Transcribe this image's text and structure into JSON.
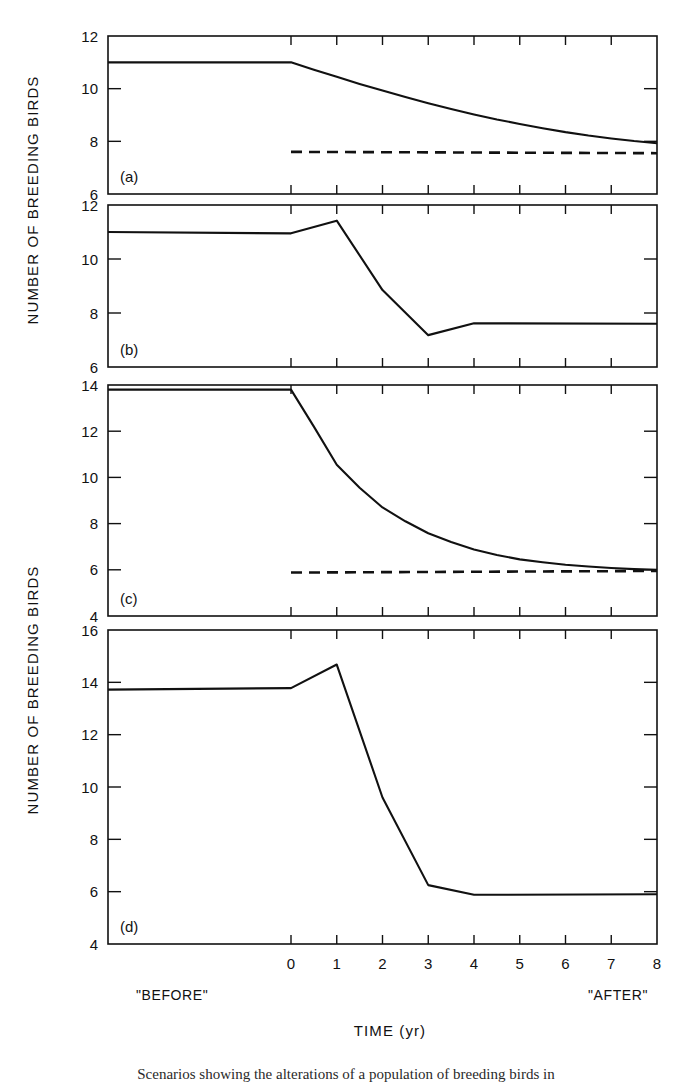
{
  "figure": {
    "ylabel_top": "NUMBER OF BREEDING BIRDS",
    "ylabel_bottom": "NUMBER OF BREEDING BIRDS",
    "xlabel": "TIME (yr)",
    "before_label": "\"BEFORE\"",
    "after_label": "\"AFTER\"",
    "caption": "Scenarios showing the alterations of a population of breeding birds in",
    "ink_color": "#111111",
    "background_color": "#ffffff"
  },
  "chart_data": [
    {
      "type": "line",
      "panel": "(a)",
      "title": "",
      "xlabel": "TIME (yr)",
      "ylabel": "NUMBER OF BREEDING BIRDS",
      "xlim": [
        -4,
        8
      ],
      "ylim": [
        6,
        12
      ],
      "xticks": [
        0,
        1,
        2,
        3,
        4,
        5,
        6,
        7,
        8
      ],
      "xticklabels": [
        "",
        "",
        "",
        "",
        "",
        "",
        "",
        "",
        ""
      ],
      "yticks": [
        6,
        8,
        10,
        12
      ],
      "yticklabels": [
        "6",
        "8",
        "10",
        "12"
      ],
      "grid": false,
      "series": [
        {
          "name": "population",
          "style": "solid",
          "x": [
            -4,
            -3,
            -2,
            -1,
            0,
            0.5,
            1,
            1.5,
            2,
            2.5,
            3,
            3.5,
            4,
            4.5,
            5,
            5.5,
            6,
            6.5,
            7,
            7.5,
            8
          ],
          "values": [
            11.0,
            11.0,
            11.0,
            11.0,
            11.0,
            10.72,
            10.45,
            10.18,
            9.93,
            9.68,
            9.45,
            9.23,
            9.02,
            8.83,
            8.66,
            8.5,
            8.35,
            8.22,
            8.11,
            8.01,
            7.93
          ]
        },
        {
          "name": "new-equilibrium",
          "style": "dashed",
          "x": [
            0,
            8
          ],
          "values": [
            7.6,
            7.55
          ]
        }
      ]
    },
    {
      "type": "line",
      "panel": "(b)",
      "title": "",
      "xlabel": "TIME (yr)",
      "ylabel": "NUMBER OF BREEDING BIRDS",
      "xlim": [
        -4,
        8
      ],
      "ylim": [
        6,
        12
      ],
      "xticks": [
        0,
        1,
        2,
        3,
        4,
        5,
        6,
        7,
        8
      ],
      "xticklabels": [
        "",
        "",
        "",
        "",
        "",
        "",
        "",
        "",
        ""
      ],
      "yticks": [
        6,
        8,
        10,
        12
      ],
      "yticklabels": [
        "6",
        "8",
        "10",
        "12"
      ],
      "grid": false,
      "series": [
        {
          "name": "population",
          "style": "solid",
          "x": [
            -4,
            0,
            1,
            2,
            3,
            4,
            8
          ],
          "values": [
            11.0,
            10.95,
            11.42,
            8.85,
            7.18,
            7.62,
            7.6
          ]
        }
      ]
    },
    {
      "type": "line",
      "panel": "(c)",
      "title": "",
      "xlabel": "TIME (yr)",
      "ylabel": "NUMBER OF BREEDING BIRDS",
      "xlim": [
        -4,
        8
      ],
      "ylim": [
        4,
        14
      ],
      "xticks": [
        0,
        1,
        2,
        3,
        4,
        5,
        6,
        7,
        8
      ],
      "xticklabels": [
        "",
        "",
        "",
        "",
        "",
        "",
        "",
        "",
        ""
      ],
      "yticks": [
        4,
        6,
        8,
        10,
        12,
        14
      ],
      "yticklabels": [
        "4",
        "6",
        "8",
        "10",
        "12",
        "14"
      ],
      "grid": false,
      "series": [
        {
          "name": "population",
          "style": "solid",
          "x": [
            -4,
            -3,
            -2,
            -1,
            0,
            0.5,
            1,
            1.5,
            2,
            2.5,
            3,
            3.5,
            4,
            4.5,
            5,
            5.5,
            6,
            6.5,
            7,
            7.5,
            8
          ],
          "values": [
            13.8,
            13.8,
            13.8,
            13.8,
            13.8,
            12.2,
            10.55,
            9.55,
            8.7,
            8.1,
            7.58,
            7.2,
            6.88,
            6.64,
            6.45,
            6.33,
            6.22,
            6.14,
            6.08,
            6.03,
            6.0
          ]
        },
        {
          "name": "new-equilibrium",
          "style": "dashed",
          "x": [
            0,
            8
          ],
          "values": [
            5.88,
            5.95
          ]
        }
      ]
    },
    {
      "type": "line",
      "panel": "(d)",
      "title": "",
      "xlabel": "TIME (yr)",
      "ylabel": "NUMBER OF BREEDING BIRDS",
      "xlim": [
        -4,
        8
      ],
      "ylim": [
        4,
        16
      ],
      "xticks": [
        0,
        1,
        2,
        3,
        4,
        5,
        6,
        7,
        8
      ],
      "xticklabels": [
        "0",
        "1",
        "2",
        "3",
        "4",
        "5",
        "6",
        "7",
        "8"
      ],
      "yticks": [
        4,
        6,
        8,
        10,
        12,
        14,
        16
      ],
      "yticklabels": [
        "4",
        "6",
        "8",
        "10",
        "12",
        "14",
        "16"
      ],
      "grid": false,
      "series": [
        {
          "name": "population",
          "style": "solid",
          "x": [
            -4,
            0,
            1,
            2,
            3,
            4,
            8
          ],
          "values": [
            13.72,
            13.78,
            14.68,
            9.6,
            6.25,
            5.88,
            5.9
          ]
        }
      ]
    }
  ]
}
